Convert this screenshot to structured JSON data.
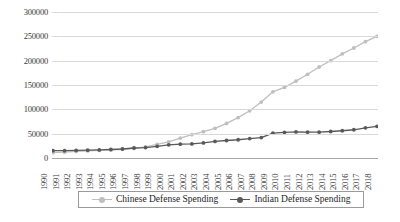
{
  "chart_data": {
    "type": "line",
    "title": "",
    "xlabel": "",
    "ylabel": "",
    "grid": true,
    "legend_position": "bottom-center",
    "ylim": [
      0,
      300000
    ],
    "yticks": [
      "0",
      "50000",
      "100000",
      "150000",
      "200000",
      "250000",
      "300000"
    ],
    "categories": [
      "1990",
      "1991",
      "1992",
      "1993",
      "1994",
      "1995",
      "1996",
      "1997",
      "1998",
      "1999",
      "2000",
      "2001",
      "2002",
      "2003",
      "2004",
      "2005",
      "2006",
      "2007",
      "2008",
      "2009",
      "2010",
      "2011",
      "2012",
      "2013",
      "2014",
      "2015",
      "2016",
      "2017",
      "2018"
    ],
    "series": [
      {
        "name": "Chinese Defense Spending",
        "color": "#bfbfbf",
        "values": [
          11000,
          12000,
          13500,
          14500,
          15500,
          16500,
          18000,
          20000,
          23000,
          28000,
          33000,
          41000,
          48000,
          54000,
          61000,
          71000,
          83000,
          97000,
          115000,
          136000,
          145000,
          158000,
          172000,
          187000,
          200000,
          214000,
          226000,
          239000,
          250000
        ]
      },
      {
        "name": "Indian Defense Spending",
        "color": "#595959",
        "values": [
          15000,
          15000,
          15500,
          16000,
          16500,
          17500,
          18500,
          20500,
          21500,
          24000,
          27000,
          28500,
          29000,
          31000,
          34000,
          36000,
          37500,
          40000,
          42000,
          51000,
          52500,
          53500,
          53000,
          53000,
          54500,
          56000,
          58000,
          62000,
          65000
        ]
      }
    ]
  },
  "legend": {
    "entries": [
      {
        "label": "Chinese Defense Spending",
        "color": "#bfbfbf"
      },
      {
        "label": "Indian Defense Spending",
        "color": "#595959"
      }
    ]
  }
}
